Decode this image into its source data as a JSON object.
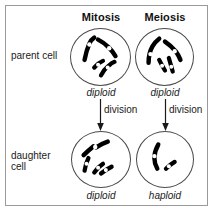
{
  "diagram": {
    "title_mitosis": "Mitosis",
    "title_meiosis": "Meiosis",
    "row_labels": {
      "parent": "parent cell",
      "daughter": "daughter\ncell"
    },
    "columns": [
      {
        "name": "mitosis",
        "header": "Mitosis",
        "parent_ploidy": "diploid",
        "daughter_ploidy": "diploid",
        "division_label": "division",
        "parent_chromosome_count": 4,
        "daughter_chromosome_count": 4
      },
      {
        "name": "meiosis",
        "header": "Meiosis",
        "parent_ploidy": "diploid",
        "daughter_ploidy": "haploid",
        "division_label": "division",
        "parent_chromosome_count": 4,
        "daughter_chromosome_count": 2
      }
    ],
    "colors": {
      "chromosome": "#000000",
      "centromere": "#ffffff",
      "cell_outline": "#4a4a4a",
      "frame": "#9a9a9a",
      "text": "#1a1a1a",
      "background": "#ffffff"
    }
  }
}
